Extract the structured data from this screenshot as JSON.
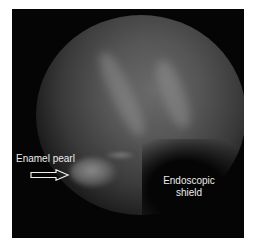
{
  "image": {
    "description": "Endoscopic view of tooth root surface showing an enamel pearl",
    "annotations": [
      {
        "label": "Enamel pearl",
        "pointer": "right-arrow"
      },
      {
        "label_lines": [
          "Endoscopic",
          "shield"
        ]
      }
    ],
    "colors": {
      "background": "#050505",
      "label": "#ececec",
      "frame_border": "#ffffff"
    }
  }
}
